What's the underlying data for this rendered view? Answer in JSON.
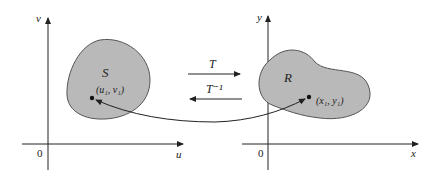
{
  "diagram": {
    "left_plane": {
      "vertical_axis_label": "v",
      "horizontal_axis_label": "u",
      "origin_label": "0",
      "region_label": "S",
      "point_label": "(u₁, v₁)"
    },
    "right_plane": {
      "vertical_axis_label": "y",
      "horizontal_axis_label": "x",
      "origin_label": "0",
      "region_label": "R",
      "point_label": "(x₁, y₁)"
    },
    "forward_map_label": "T",
    "inverse_map_label": "T⁻¹",
    "colors": {
      "region_fill": "#b9b9b9",
      "region_stroke": "#555555",
      "axis": "#222222"
    }
  }
}
